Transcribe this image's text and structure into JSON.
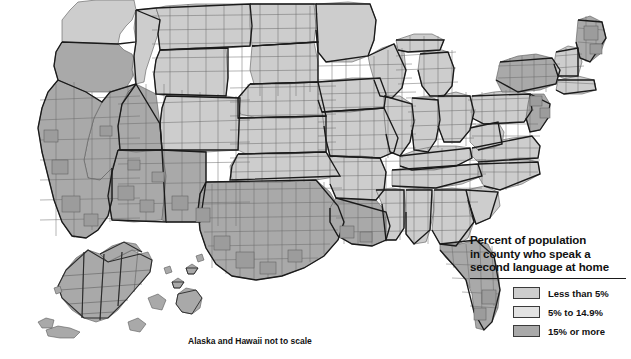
{
  "map": {
    "title_caption": "Alaska and Hawaii not to scale",
    "background_color": "#ffffff",
    "county_border_color": "#5a5a5a",
    "state_border_color": "#1a1a1a",
    "water_color": "#ffffff"
  },
  "legend": {
    "title_line1": "Percent of population",
    "title_line2": "in county who speak a",
    "title_line3": "second language at home",
    "items": [
      {
        "label": "Less than 5%",
        "color": "#cdcdcd"
      },
      {
        "label": "5% to 14.9%",
        "color": "#e2e2e2"
      },
      {
        "label": "15% or more",
        "color": "#a9a9a9"
      }
    ]
  },
  "chart_data": {
    "type": "map",
    "title": "Percent of population in county who speak a second language at home",
    "classes": [
      {
        "label": "Less than 5%",
        "color": "#cdcdcd",
        "min": 0,
        "max": 5
      },
      {
        "label": "5% to 14.9%",
        "color": "#e2e2e2",
        "min": 5,
        "max": 14.9
      },
      {
        "label": "15% or more",
        "color": "#a9a9a9",
        "min": 15,
        "max": 100
      }
    ],
    "regions": [
      {
        "name": "California",
        "class": "15% or more"
      },
      {
        "name": "Arizona",
        "class": "15% or more"
      },
      {
        "name": "New Mexico",
        "class": "15% or more"
      },
      {
        "name": "Texas",
        "class": "15% or more"
      },
      {
        "name": "Nevada",
        "class": "15% or more"
      },
      {
        "name": "Florida (south)",
        "class": "15% or more"
      },
      {
        "name": "New York (metro)",
        "class": "15% or more"
      },
      {
        "name": "New Jersey",
        "class": "15% or more"
      },
      {
        "name": "Maine (north)",
        "class": "15% or more"
      },
      {
        "name": "Louisiana (south)",
        "class": "15% or more"
      },
      {
        "name": "Alaska",
        "class": "15% or more"
      },
      {
        "name": "Hawaii",
        "class": "15% or more"
      },
      {
        "name": "Great Plains",
        "class": "Less than 5%"
      },
      {
        "name": "Southeast",
        "class": "Less than 5%"
      },
      {
        "name": "Midwest",
        "class": "Less than 5%"
      },
      {
        "name": "Appalachia",
        "class": "Less than 5%"
      },
      {
        "name": "Mountain West (scattered)",
        "class": "5% to 14.9%"
      },
      {
        "name": "Upper Midwest (scattered)",
        "class": "5% to 14.9%"
      }
    ],
    "insets": [
      "Alaska",
      "Hawaii"
    ],
    "legend_position": "bottom-right",
    "grid": false
  }
}
